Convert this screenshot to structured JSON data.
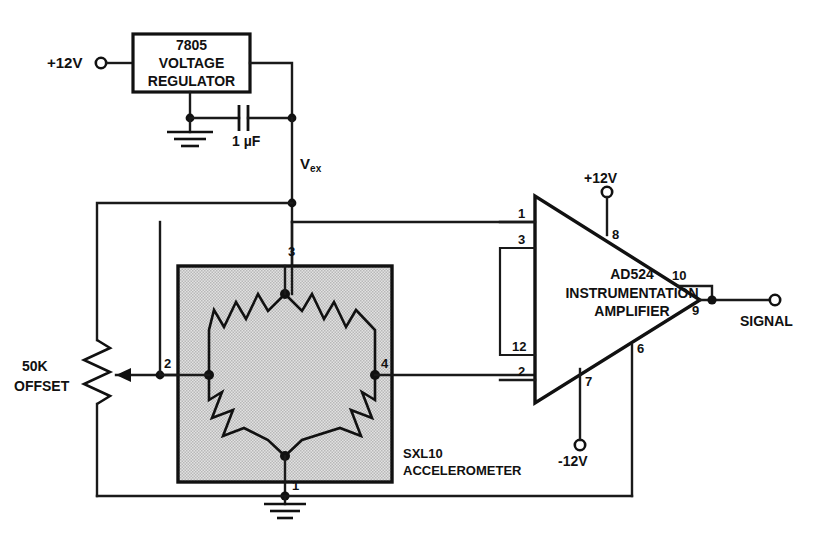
{
  "power_input": {
    "label": "+12V",
    "terminal": "input-terminal"
  },
  "regulator": {
    "part": "7805",
    "line1": "VOLTAGE",
    "line2": "REGULATOR"
  },
  "capacitor": {
    "value": "1 µF"
  },
  "excitation": {
    "label_main": "V",
    "label_sub": "ex"
  },
  "potentiometer": {
    "value": "50K",
    "function": "OFFSET"
  },
  "sensor": {
    "part": "SXL10",
    "type": "ACCELEROMETER",
    "pins": {
      "excitation": "3",
      "out_minus": "2",
      "out_plus": "4",
      "ground": "1"
    },
    "elements": 4
  },
  "amplifier": {
    "part": "AD524",
    "line1": "INSTRUMENTATION",
    "line2": "AMPLIFIER",
    "pins": {
      "in_plus": "1",
      "gain_a": "3",
      "gain_b": "12",
      "in_minus": "2",
      "v_plus": "8",
      "v_minus": "7",
      "sense": "10",
      "output": "9",
      "reference": "6"
    },
    "supply_positive": "+12V",
    "supply_negative": "-12V"
  },
  "output": {
    "label": "SIGNAL"
  },
  "colors": {
    "ink": "#111111",
    "paper": "#ffffff",
    "sensor_fill": "#d4d4d4"
  }
}
